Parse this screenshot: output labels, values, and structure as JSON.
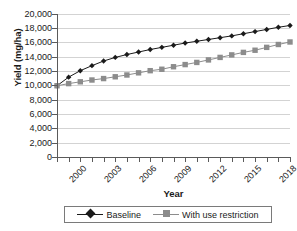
{
  "chart_data": {
    "type": "line",
    "title": "",
    "xlabel": "Year",
    "ylabel": "Yield (mg/ha)",
    "ylim": [
      0,
      20000
    ],
    "xlim": [
      2000,
      2020
    ],
    "grid": "horizontal",
    "legend_position": "bottom",
    "y_ticks": [
      20000,
      18000,
      16000,
      14000,
      12000,
      10000,
      8000,
      6000,
      4000,
      2000,
      0
    ],
    "y_tick_labels": [
      "20,000",
      "18,000",
      "16,000",
      "14,000",
      "12,000",
      "10,000",
      "8,000",
      "6,000",
      "4,000",
      "2,000",
      "0"
    ],
    "x": [
      2000,
      2001,
      2002,
      2003,
      2004,
      2005,
      2006,
      2007,
      2008,
      2009,
      2010,
      2011,
      2012,
      2013,
      2014,
      2015,
      2016,
      2017,
      2018,
      2019,
      2020
    ],
    "x_tick_labels": [
      "2000",
      "",
      "",
      "2003",
      "",
      "",
      "2006",
      "",
      "",
      "2009",
      "",
      "",
      "2012",
      "",
      "",
      "2015",
      "",
      "",
      "2018",
      "",
      ""
    ],
    "x_labeled_values": [
      "2000",
      "2003",
      "2006",
      "2009",
      "2012",
      "2015",
      "2018"
    ],
    "series": [
      {
        "name": "Baseline",
        "color": "#1a1a1a",
        "marker": "diamond",
        "values": [
          10000,
          11200,
          12100,
          12800,
          13450,
          13950,
          14350,
          14700,
          15050,
          15350,
          15650,
          15950,
          16200,
          16450,
          16700,
          16950,
          17250,
          17550,
          17850,
          18150,
          18400
        ]
      },
      {
        "name": "With use restriction",
        "color": "#8c8c8c",
        "marker": "square",
        "values": [
          10000,
          10300,
          10550,
          10800,
          11000,
          11250,
          11500,
          11800,
          12100,
          12300,
          12650,
          12950,
          13250,
          13600,
          13950,
          14300,
          14650,
          14950,
          15350,
          15750,
          16100
        ]
      }
    ]
  }
}
